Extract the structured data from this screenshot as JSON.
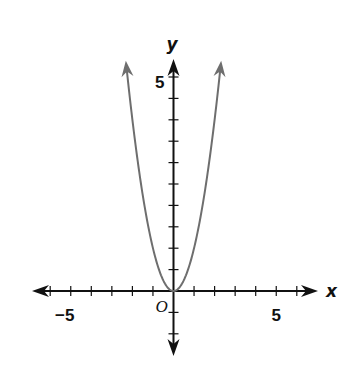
{
  "chart_data": {
    "type": "line",
    "title": "",
    "function": "y = x^2",
    "xlabel": "x",
    "ylabel": "y",
    "origin_label": "O",
    "xlim": [
      -6.7,
      7
    ],
    "ylim": [
      -3,
      5.9
    ],
    "x_ticks": [
      -6,
      -5,
      -4,
      -3,
      -2,
      -1,
      1,
      2,
      3,
      4,
      5,
      6
    ],
    "y_ticks": [
      -1,
      -0.5,
      0.5,
      1,
      1.5,
      2,
      2.5,
      3,
      3.5,
      4,
      4.5,
      5
    ],
    "x_tick_labels": [
      {
        "value": -5,
        "text": "−5"
      },
      {
        "value": 5,
        "text": "5"
      }
    ],
    "y_tick_labels": [
      {
        "value": 5,
        "text": "5"
      }
    ],
    "series": [
      {
        "name": "parabola",
        "color": "#6e6e6e",
        "domain": [
          -2.32,
          2.32
        ],
        "points": [
          [
            -2.3,
            5.29
          ],
          [
            -2,
            4
          ],
          [
            -1.5,
            2.25
          ],
          [
            -1,
            1
          ],
          [
            -0.5,
            0.25
          ],
          [
            0,
            0
          ],
          [
            0.5,
            0.25
          ],
          [
            1,
            1
          ],
          [
            1.5,
            2.25
          ],
          [
            2,
            4
          ],
          [
            2.3,
            5.29
          ]
        ],
        "arrows_both_ends": true
      }
    ],
    "axis_color": "#111111",
    "grid": false,
    "legend": "none"
  }
}
